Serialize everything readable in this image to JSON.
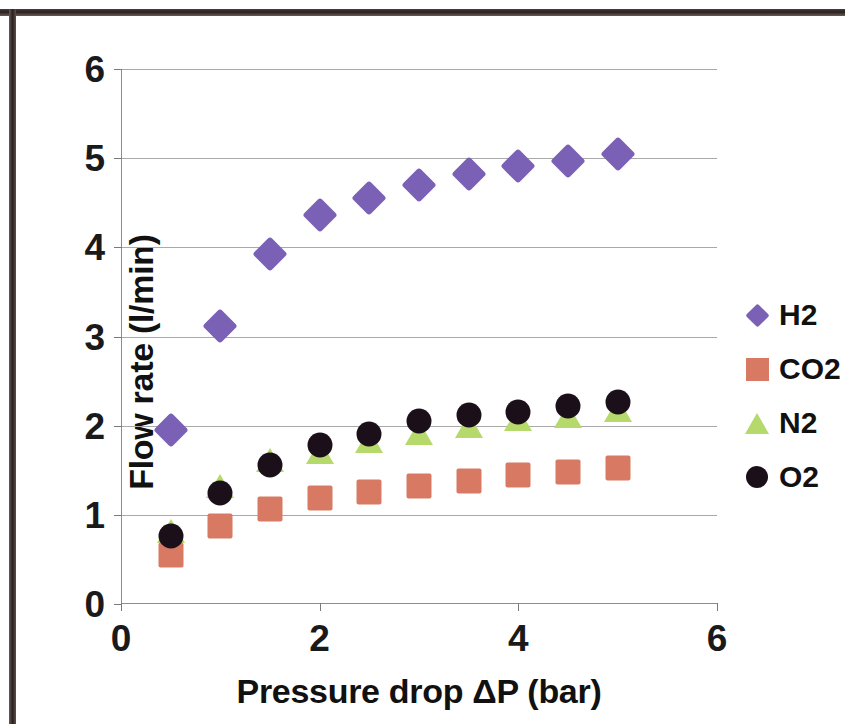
{
  "chart_data": {
    "type": "scatter",
    "title": "",
    "xlabel": "Pressure drop ΔP (bar)",
    "ylabel": "Flow rate (l/min)",
    "xlim": [
      0,
      6
    ],
    "ylim": [
      0,
      6
    ],
    "xticks": [
      "0",
      "2",
      "4",
      "6"
    ],
    "xtick_values": [
      0,
      2,
      4,
      6
    ],
    "yticks": [
      "0",
      "1",
      "2",
      "3",
      "4",
      "5",
      "6"
    ],
    "ytick_values": [
      0,
      1,
      2,
      3,
      4,
      5,
      6
    ],
    "grid": "horizontal",
    "legend_position": "right",
    "x": [
      0.5,
      1.0,
      1.5,
      2.0,
      2.5,
      3.0,
      3.5,
      4.0,
      4.5,
      5.0
    ],
    "series": [
      {
        "name": "H2",
        "marker": "diamond",
        "color": "#7B61B5",
        "values": [
          1.95,
          3.12,
          3.92,
          4.36,
          4.55,
          4.7,
          4.82,
          4.91,
          4.97,
          5.05
        ]
      },
      {
        "name": "CO2",
        "marker": "square",
        "color": "#D87A63",
        "values": [
          0.55,
          0.88,
          1.06,
          1.19,
          1.26,
          1.32,
          1.38,
          1.45,
          1.48,
          1.53
        ]
      },
      {
        "name": "N2",
        "marker": "triangle",
        "color": "#B5D96A",
        "values": [
          0.82,
          1.32,
          1.62,
          1.7,
          1.83,
          1.92,
          2.0,
          2.07,
          2.11,
          2.18
        ]
      },
      {
        "name": "O2",
        "marker": "circle",
        "color": "#1B1019",
        "values": [
          0.76,
          1.25,
          1.56,
          1.78,
          1.91,
          2.05,
          2.12,
          2.15,
          2.22,
          2.27
        ]
      }
    ]
  },
  "legend": {
    "items": [
      {
        "label": "H2",
        "marker": "diamond",
        "color": "#7B61B5"
      },
      {
        "label": "CO2",
        "marker": "square",
        "color": "#D87A63"
      },
      {
        "label": "N2",
        "marker": "triangle",
        "color": "#B5D96A"
      },
      {
        "label": "O2",
        "marker": "circle",
        "color": "#1B1019"
      }
    ]
  }
}
